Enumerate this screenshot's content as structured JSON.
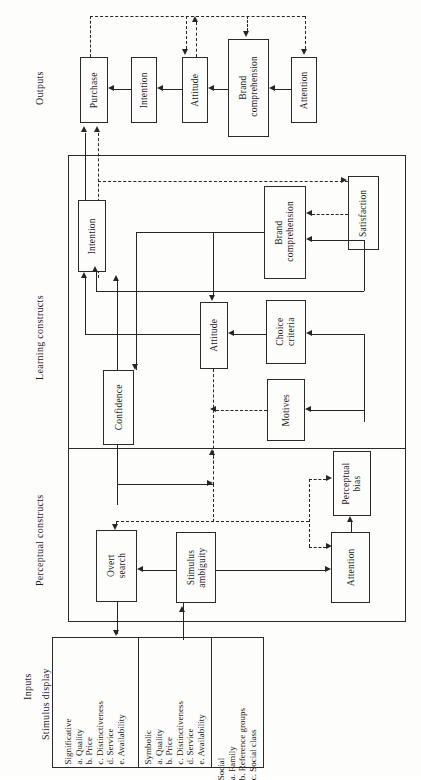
{
  "diagram": {
    "sections": {
      "outputs": "Outputs",
      "learning": "Learning constructs",
      "perceptual": "Perceptual constructs",
      "inputs": "Inputs",
      "stimulus_display": "Stimulus display"
    },
    "outputs_boxes": [
      {
        "id": "out-purchase",
        "label": "Purchase"
      },
      {
        "id": "out-intention",
        "label": "Intention"
      },
      {
        "id": "out-attitude",
        "label": "Attitude"
      },
      {
        "id": "out-brand-comprehension",
        "label": "Brand comprehension"
      },
      {
        "id": "out-attention",
        "label": "Attention"
      }
    ],
    "learning_boxes": [
      {
        "id": "lrn-intention",
        "label": "Intention"
      },
      {
        "id": "lrn-confidence",
        "label": "Confidence"
      },
      {
        "id": "lrn-attitude",
        "label": "Attitude"
      },
      {
        "id": "lrn-brand-comprehension",
        "label": "Brand comprehension"
      },
      {
        "id": "lrn-satisfaction",
        "label": "Satisfaction"
      },
      {
        "id": "lrn-choice-criteria",
        "label": "Choice criteria"
      },
      {
        "id": "lrn-motives",
        "label": "Motives"
      }
    ],
    "perceptual_boxes": [
      {
        "id": "per-overt-search",
        "label": "Overt search"
      },
      {
        "id": "per-stimulus-ambiguity",
        "label": "Stimulus ambiguity"
      },
      {
        "id": "per-attention",
        "label": "Attention"
      },
      {
        "id": "per-perceptual-bias",
        "label": "Perceptual bias"
      }
    ],
    "input_columns": [
      {
        "id": "significative",
        "heading": "Significative",
        "items": [
          "a.  Quality",
          "b.  Price",
          "c.  Distinctiveness",
          "d.  Service",
          "e.  Availability"
        ]
      },
      {
        "id": "symbolic",
        "heading": "Symbolic",
        "items": [
          "a.  Quality",
          "b.  Price",
          "c.  Distinctiveness",
          "d.  Service",
          "e.  Availability"
        ]
      },
      {
        "id": "social",
        "heading": "Social",
        "items": [
          "a.  Family",
          "b.  Reference groups",
          "c.  Social class"
        ]
      }
    ],
    "colors": {
      "ink": "#262626",
      "paper": "#fdfdfb",
      "frame": "#2a2a2a"
    }
  }
}
